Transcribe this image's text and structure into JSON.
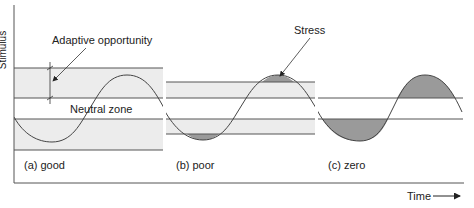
{
  "figure": {
    "y_axis_label": "Stimulus",
    "x_axis_label": "Time",
    "annotations": {
      "adaptive_opportunity": "Adaptive opportunity",
      "neutral_zone": "Neutral zone",
      "stress": "Stress"
    },
    "panels": [
      {
        "id": "a",
        "label": "(a) good"
      },
      {
        "id": "b",
        "label": "(b) poor"
      },
      {
        "id": "c",
        "label": "(c) zero"
      }
    ],
    "colors": {
      "band": "#ececec",
      "stress_fill": "#9a9a9a",
      "line": "#555555",
      "curve": "#444444"
    }
  }
}
